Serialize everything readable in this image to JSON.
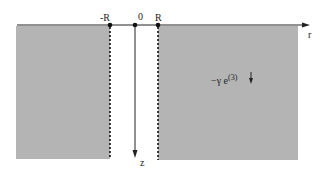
{
  "diagram": {
    "axes": {
      "horizontal_label": "r",
      "vertical_label": "z"
    },
    "points": [
      {
        "label": "-R",
        "x": 110
      },
      {
        "label": "0",
        "x": 135
      },
      {
        "label": "R",
        "x": 158
      }
    ],
    "force_label": {
      "prefix": "−γ e",
      "superscript": "(3)"
    },
    "colors": {
      "region_fill": "#b4b4b4",
      "axis": "#222222"
    }
  }
}
